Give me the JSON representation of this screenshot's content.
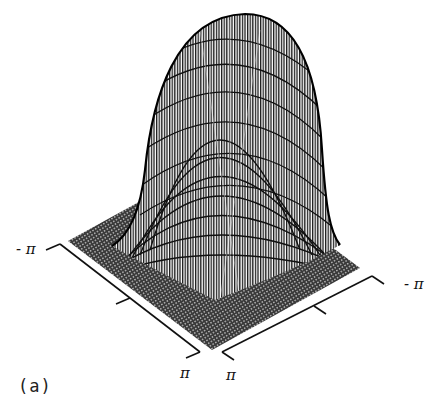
{
  "figure": {
    "caption": "(a)",
    "type": "3d-surface-wireframe",
    "axes": {
      "left_axis": {
        "start_label": "- π",
        "end_label": "π"
      },
      "right_axis": {
        "start_label": "π",
        "end_label": "- π"
      }
    },
    "colors": {
      "ink": "#111111",
      "background": "#ffffff"
    }
  }
}
